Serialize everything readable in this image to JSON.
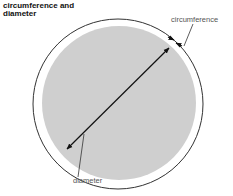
{
  "diagram": {
    "title": "circumference and\ndiameter",
    "labels": {
      "circumference": "circumference",
      "diameter": "diameter"
    },
    "shapes": {
      "outer_circle": {
        "cx": 118,
        "cy": 104,
        "r": 85,
        "stroke": "#333333"
      },
      "inner_disc": {
        "cx": 119,
        "cy": 103,
        "r": 77,
        "fill": "#cfcfcf"
      },
      "diameter_arrow": {
        "x1": 67,
        "y1": 149,
        "x2": 169,
        "y2": 48,
        "stroke": "#111111"
      }
    }
  }
}
